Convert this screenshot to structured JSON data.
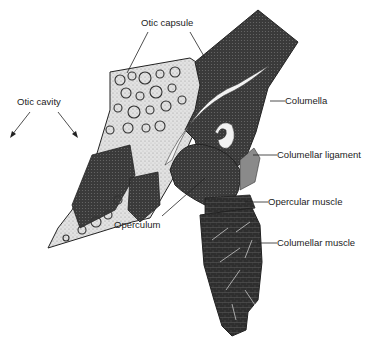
{
  "figure": {
    "labels": {
      "otic_capsule": "Otic capsule",
      "otic_cavity": "Otic cavity",
      "columella": "Columella",
      "columellar_ligament": "Columellar ligament",
      "operculum": "Operculum",
      "opercular_muscle": "Opercular muscle",
      "columellar_muscle": "Columellar muscle"
    },
    "colors": {
      "dark_tissue": "#3a3a3a",
      "bone_light": "#d9d9d9",
      "ink": "#1c1c1c",
      "background": "#ffffff"
    }
  }
}
